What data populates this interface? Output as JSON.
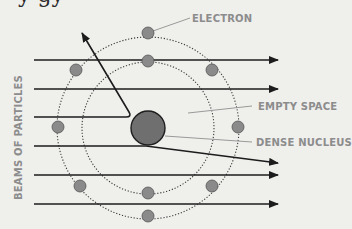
{
  "diagram": {
    "top_fragment_text": "y gy",
    "labels": {
      "electron": "ELECTRON",
      "empty_space": "EMPTY SPACE",
      "dense_nucleus": "DENSE NUCLEUS",
      "beams": "BEAMS OF PARTICLES"
    },
    "colors": {
      "background": "#efefec",
      "label_text": "#8c8c8c",
      "nucleus": "#6f6f6f",
      "electron": "#8a8a8a",
      "beam": "#1c1c1c"
    },
    "nucleus": {
      "cx": 148,
      "cy": 128,
      "r": 17
    },
    "orbits": [
      {
        "name": "inner",
        "r": 66
      },
      {
        "name": "outer",
        "r": 91
      }
    ],
    "electrons_count": 12,
    "beams": [
      {
        "y": 60,
        "type": "straight"
      },
      {
        "y": 89,
        "type": "straight"
      },
      {
        "y": 117,
        "type": "reflected"
      },
      {
        "y": 146,
        "type": "deflected"
      },
      {
        "y": 175,
        "type": "straight"
      },
      {
        "y": 204,
        "type": "straight"
      }
    ]
  }
}
